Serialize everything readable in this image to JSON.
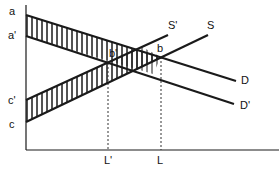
{
  "diagram": {
    "type": "supply-demand",
    "axes": {
      "y_axis_label": "",
      "x_axis_label": ""
    },
    "intercept_labels": {
      "a": "a",
      "a_prime": "a'",
      "c_prime": "c'",
      "c": "c"
    },
    "curve_labels": {
      "S": "S",
      "S_prime": "S'",
      "D": "D",
      "D_prime": "D'"
    },
    "point_labels": {
      "b": "b",
      "b_prime": "b'"
    },
    "quantity_labels": {
      "L": "L",
      "L_prime": "L'"
    },
    "colors": {
      "line": "#1a1a1a",
      "hatch": "#1a1a1a",
      "guide": "#333333"
    }
  }
}
